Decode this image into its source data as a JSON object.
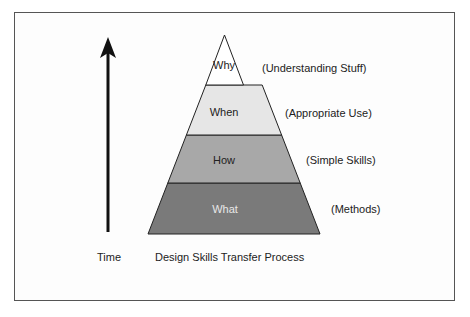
{
  "diagram": {
    "title": "Design Skills Transfer Process",
    "axis_label": "Time",
    "axis_direction": "up",
    "layers": [
      {
        "name": "Why",
        "description": "(Understanding Stuff)",
        "fill": "#ffffff",
        "text_color": "#222222"
      },
      {
        "name": "When",
        "description": "(Appropriate Use)",
        "fill": "#e6e6e6",
        "text_color": "#222222"
      },
      {
        "name": "How",
        "description": "(Simple Skills)",
        "fill": "#a8a8a8",
        "text_color": "#222222"
      },
      {
        "name": "What",
        "description": "(Methods)",
        "fill": "#7a7a7a",
        "text_color": "#e8e8e8"
      }
    ]
  }
}
